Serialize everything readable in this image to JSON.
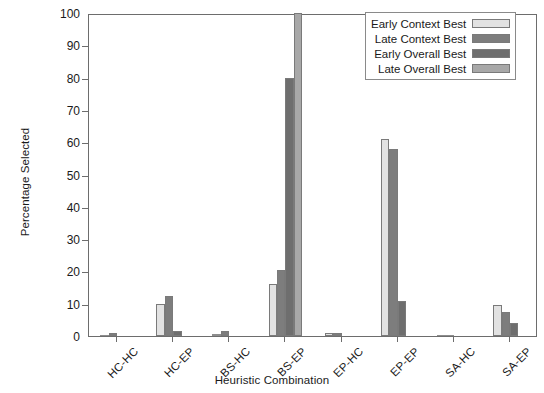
{
  "chart_data": {
    "type": "bar",
    "title": "",
    "xlabel": "Heuristic Combination",
    "ylabel": "Percentage Selected",
    "ylim": [
      0,
      100
    ],
    "ytick_step": 10,
    "yticks": [
      0,
      10,
      20,
      30,
      40,
      50,
      60,
      70,
      80,
      90,
      100
    ],
    "ytick_labels": [
      "0",
      "10",
      "20",
      "30",
      "40",
      "50",
      "60",
      "70",
      "80",
      "90",
      "100"
    ],
    "grid": false,
    "legend_position": "top-right",
    "xtick_rotation": -45,
    "categories": [
      "HC-HC",
      "HC-EP",
      "BS-HC",
      "BS-EP",
      "EP-HC",
      "EP-EP",
      "SA-HC",
      "SA-EP"
    ],
    "series": [
      {
        "name": "Early Context Best",
        "color": "#e2e2e2",
        "values": [
          0.4,
          10.0,
          0.6,
          16.0,
          0.8,
          61.0,
          0.3,
          9.5
        ]
      },
      {
        "name": "Late Context Best",
        "color": "#7d7d7d",
        "values": [
          1.0,
          12.5,
          1.4,
          20.5,
          1.0,
          58.0,
          0.3,
          7.5
        ]
      },
      {
        "name": "Early Overall Best",
        "color": "#6e6e6e",
        "values": [
          0.0,
          1.5,
          0.0,
          80.0,
          0.0,
          10.7,
          0.0,
          4.0
        ]
      },
      {
        "name": "Late Overall Best",
        "color": "#a8a8a8",
        "values": [
          0.0,
          0.0,
          0.0,
          100.0,
          0.0,
          0.0,
          0.0,
          0.0
        ]
      }
    ]
  }
}
